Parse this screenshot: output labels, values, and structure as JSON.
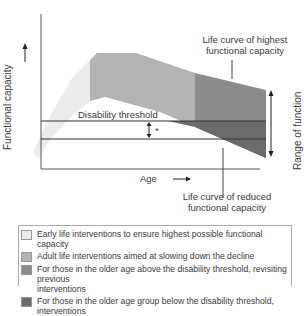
{
  "diagram": {
    "y_axis_label": "Functional capacity →",
    "x_axis_label": "Age →",
    "disability_threshold_label": "Disability threshold",
    "asterisk": "*",
    "top_annotation": [
      "Life curve of highest",
      "functional capacity"
    ],
    "bottom_annotation": [
      "Life curve of reduced",
      "functional capacity"
    ],
    "range_label": "Range of function",
    "colors": {
      "early": "#ececec",
      "adult": "#b3b3b3",
      "older_above": "#8c8c8c",
      "older_below": "#6b6b6b",
      "axis": "#555555"
    }
  },
  "legend": {
    "items": [
      {
        "label": "Early life interventions to ensure highest possible functional capacity",
        "color": "#ececec"
      },
      {
        "label": "Adult life interventions aimed at slowing down the decline",
        "color": "#b3b3b3"
      },
      {
        "label": "For those in the older age above the disability threshold, revisiting previous",
        "label2": "interventions",
        "color": "#8c8c8c"
      },
      {
        "label": "For those in the older age group below the disability threshold, interventions",
        "color": "#6b6b6b"
      }
    ]
  }
}
